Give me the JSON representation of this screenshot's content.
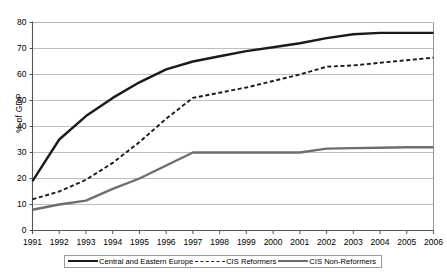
{
  "chart_data": {
    "type": "line",
    "title": "",
    "xlabel": "",
    "ylabel": "% of GDP",
    "grid": true,
    "legend_position": "bottom",
    "xlim": [
      1991,
      2006
    ],
    "ylim": [
      0,
      80
    ],
    "ytick_step": 10,
    "categories": [
      "1991",
      "1992",
      "1993",
      "1994",
      "1995",
      "1996",
      "1997",
      "1998",
      "1999",
      "2000",
      "2001",
      "2002",
      "2003",
      "2004",
      "2005",
      "2006"
    ],
    "ytick_labels": [
      "0",
      "10",
      "20",
      "30",
      "40",
      "50",
      "60",
      "70",
      "80"
    ],
    "series": [
      {
        "name": "Central and Eastern Europe",
        "style": "solid",
        "color": "#1a1a1a",
        "values": [
          19,
          35,
          44,
          51,
          57,
          62,
          65,
          67,
          69,
          70.5,
          72,
          74,
          75.5,
          76,
          76,
          76
        ]
      },
      {
        "name": "CIS Reformers",
        "style": "dashed",
        "color": "#1a1a1a",
        "values": [
          12,
          15,
          19.5,
          26,
          34,
          43,
          51,
          53,
          55,
          57.5,
          60,
          63,
          63.5,
          64.5,
          65.5,
          66.5
        ]
      },
      {
        "name": "CIS Non-Reformers",
        "style": "solid",
        "color": "#6e6e6e",
        "values": [
          8,
          10,
          11.5,
          16,
          20,
          25,
          30,
          30,
          30,
          30,
          30,
          31.5,
          31.7,
          31.8,
          32,
          32
        ]
      }
    ]
  },
  "axes": {
    "y_title": "% of GDP"
  },
  "legend": {
    "items": [
      {
        "label": "Central and Eastern Europe",
        "swatch": "line-solid-dark-swatch"
      },
      {
        "label": "CIS Reformers",
        "swatch": "line-dashed-swatch"
      },
      {
        "label": "CIS Non-Reformers",
        "swatch": "line-solid-gray-swatch"
      }
    ]
  }
}
